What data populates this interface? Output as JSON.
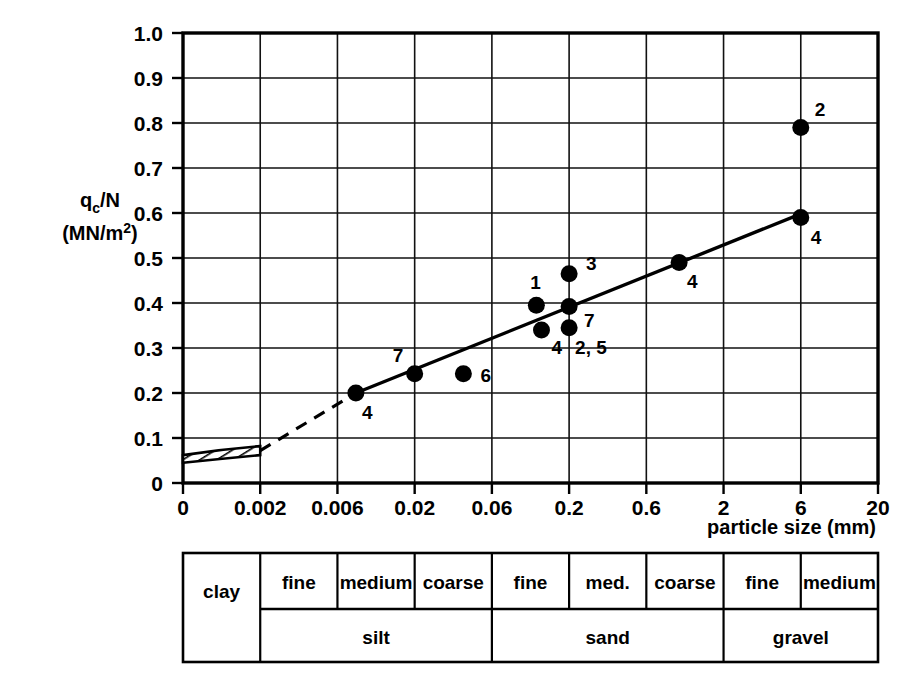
{
  "chart_data": {
    "type": "scatter",
    "title": "",
    "xlabel": "particle size (mm)",
    "ylabel": "q_c/N",
    "ylabel_units": "(MN/m2)",
    "ylabel_main_prefix": "q",
    "ylabel_main_sub": "c",
    "ylabel_main_suffix": "/N",
    "ylabel_units_prefix": "(MN/m",
    "ylabel_units_sup": "2",
    "ylabel_units_suffix": ")",
    "x_scale": "log-like categorical ticks",
    "x_ticks": [
      "0",
      "0.002",
      "0.006",
      "0.02",
      "0.06",
      "0.2",
      "0.6",
      "2",
      "6",
      "20"
    ],
    "x_tick_values": [
      0,
      0.002,
      0.006,
      0.02,
      0.06,
      0.2,
      0.6,
      2,
      6,
      20
    ],
    "y_ticks": [
      "0",
      "0.1",
      "0.2",
      "0.3",
      "0.4",
      "0.5",
      "0.6",
      "0.7",
      "0.8",
      "0.9",
      "1.0"
    ],
    "y_tick_values": [
      0,
      0.1,
      0.2,
      0.3,
      0.4,
      0.5,
      0.6,
      0.7,
      0.8,
      0.9,
      1.0
    ],
    "ylim": [
      0,
      1.0
    ],
    "grid": true,
    "legend": "none",
    "points": [
      {
        "label": "4",
        "x": 0.008,
        "y": 0.2,
        "label_dx": 6,
        "label_dy": 26
      },
      {
        "label": "7",
        "x": 0.02,
        "y": 0.243,
        "label_dx": -22,
        "label_dy": -12
      },
      {
        "label": "6",
        "x": 0.04,
        "y": 0.243,
        "label_dx": 17,
        "label_dy": 8
      },
      {
        "label": "1",
        "x": 0.12,
        "y": 0.395,
        "label_dx": -6,
        "label_dy": -16
      },
      {
        "label": "4",
        "x": 0.13,
        "y": 0.34,
        "label_dx": 10,
        "label_dy": 24
      },
      {
        "label": "3",
        "x": 0.2,
        "y": 0.465,
        "label_dx": 17,
        "label_dy": -4
      },
      {
        "label": "7",
        "x": 0.2,
        "y": 0.392,
        "label_dx": 15,
        "label_dy": 20
      },
      {
        "label": "2, 5",
        "x": 0.2,
        "y": 0.345,
        "label_dx": 6,
        "label_dy": 26
      },
      {
        "label": "4",
        "x": 1.0,
        "y": 0.49,
        "label_dx": 8,
        "label_dy": 25
      },
      {
        "label": "2",
        "x": 6.0,
        "y": 0.79,
        "label_dx": 14,
        "label_dy": -12
      },
      {
        "label": "4",
        "x": 6.0,
        "y": 0.59,
        "label_dx": 10,
        "label_dy": 26
      }
    ],
    "trend_line": {
      "style": "solid",
      "from": {
        "x": 0.008,
        "y": 0.2
      },
      "to": {
        "x": 6.0,
        "y": 0.598
      }
    },
    "dashed_extension": {
      "style": "dashed",
      "from": {
        "x": 0.002,
        "y": 0.072
      },
      "to": {
        "x": 0.008,
        "y": 0.2
      }
    },
    "hatched_band": {
      "description": "hatched clay band",
      "x_from": 0.0,
      "x_to": 0.002,
      "y_low_left": 0.045,
      "y_high_left": 0.062,
      "y_low_right": 0.062,
      "y_high_right": 0.082
    }
  },
  "soil_table": {
    "top_row": [
      {
        "label": "",
        "span": 1
      },
      {
        "label": "fine",
        "span": 1
      },
      {
        "label": "medium",
        "span": 1
      },
      {
        "label": "coarse",
        "span": 1
      },
      {
        "label": "fine",
        "span": 1
      },
      {
        "label": "med.",
        "span": 1
      },
      {
        "label": "coarse",
        "span": 1
      },
      {
        "label": "fine",
        "span": 1
      },
      {
        "label": "medium",
        "span": 1
      }
    ],
    "bottom_row": [
      {
        "label": "clay",
        "span": 1
      },
      {
        "label": "silt",
        "span": 3
      },
      {
        "label": "sand",
        "span": 3
      },
      {
        "label": "gravel",
        "span": 2
      }
    ],
    "clay_label": "clay",
    "silt_label": "silt",
    "sand_label": "sand",
    "gravel_label": "gravel",
    "sub_fine_1": "fine",
    "sub_medium_1": "medium",
    "sub_coarse_1": "coarse",
    "sub_fine_2": "fine",
    "sub_med_2": "med.",
    "sub_coarse_2": "coarse",
    "sub_fine_3": "fine",
    "sub_medium_3": "medium"
  },
  "colors": {
    "ink": "#000000",
    "background": "#ffffff",
    "grid": "#1a1a1a"
  }
}
